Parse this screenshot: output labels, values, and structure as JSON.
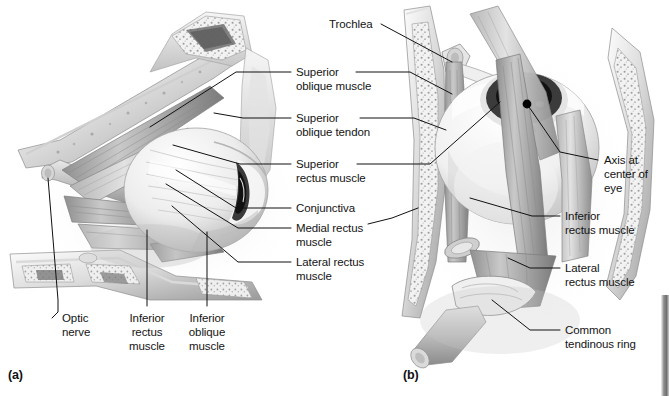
{
  "figure": {
    "background_color": "#ffffff",
    "ink_color": "#141414",
    "width": 669,
    "height": 396
  },
  "panels": [
    {
      "id": "a",
      "letter": "(a)",
      "view": "lateral view of right orbit"
    },
    {
      "id": "b",
      "letter": "(b)",
      "view": "anterior view of right eye"
    }
  ],
  "labels": {
    "trochlea": "Trochlea",
    "superior_oblique_muscle_l1": "Superior",
    "superior_oblique_muscle_l2": "oblique muscle",
    "superior_oblique_tendon_l1": "Superior",
    "superior_oblique_tendon_l2": "oblique tendon",
    "superior_rectus_muscle_l1": "Superior",
    "superior_rectus_muscle_l2": "rectus muscle",
    "conjunctiva": "Conjunctiva",
    "medial_rectus_muscle_l1": "Medial rectus",
    "medial_rectus_muscle_l2": "muscle",
    "lateral_rectus_muscle_l1": "Lateral rectus",
    "lateral_rectus_muscle_l2": "muscle",
    "optic_nerve_l1": "Optic",
    "optic_nerve_l2": "nerve",
    "inferior_rectus_muscle_l1": "Inferior",
    "inferior_rectus_muscle_l2": "rectus",
    "inferior_rectus_muscle_l3": "muscle",
    "inferior_oblique_muscle_l1": "Inferior",
    "inferior_oblique_muscle_l2": "oblique",
    "inferior_oblique_muscle_l3": "muscle",
    "axis_at_center_of_eye_l1": "Axis at",
    "axis_at_center_of_eye_l2": "center of",
    "axis_at_center_of_eye_l3": "eye",
    "inferior_rectus_muscle_b_l1": "Inferior",
    "inferior_rectus_muscle_b_l2": "rectus muscle",
    "lateral_rectus_muscle_b_l1": "Lateral",
    "lateral_rectus_muscle_b_l2": "rectus muscle",
    "common_tendinous_ring_l1": "Common",
    "common_tendinous_ring_l2": "tendinous ring"
  }
}
